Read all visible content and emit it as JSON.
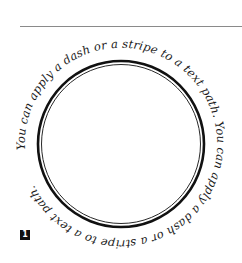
{
  "figure": {
    "path_text": "You can apply a dash or a stripe to a text path. You can apply a dash or a stripe to a text path.",
    "phrase": "You can apply a dash or a stripe to a text path.",
    "badge_label": "1",
    "colors": {
      "rule": "#8a8a8a",
      "ring": "#111111",
      "text": "#1a1a1a",
      "badge_bg": "#111111",
      "badge_fg": "#ffffff"
    }
  }
}
